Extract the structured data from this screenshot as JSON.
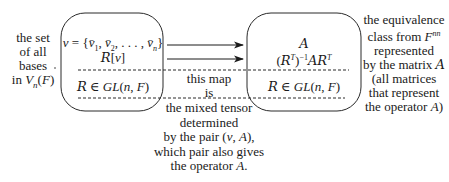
{
  "left_label": {
    "lines": [
      "the set",
      "of all",
      "bases",
      "in V_n(F)"
    ]
  },
  "left_box": {
    "top_line": "v = {v̄₁, v̄₂, . . . , v̄ₙ}",
    "second_line": "𝓡[v]",
    "bottom_line": "𝓡 ∈ GL(n, F)"
  },
  "right_box": {
    "top_line": "𝓐",
    "second_line": "(𝓡ᵀ)⁻¹𝓐𝓡ᵀ",
    "bottom_line": "𝓡 ∈ GL(n, F)"
  },
  "middle_label": {
    "lines": [
      "this map",
      "is",
      "the mixed tensor",
      "determined",
      "by the pair (v, A),",
      "which pair also gives",
      "the operator A."
    ]
  },
  "right_label": {
    "lines": [
      "the equivalence",
      "class from F^{nn}",
      "represented",
      "by the matrix 𝓐",
      "(all matrices",
      "that represent",
      "the operator A)"
    ]
  },
  "arrows": [
    {
      "from": "v",
      "to": "A"
    },
    {
      "from": "R[v]",
      "to": "(R^T)^-1 A R^T"
    }
  ]
}
